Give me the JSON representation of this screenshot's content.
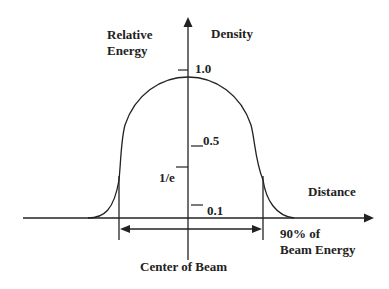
{
  "diagram": {
    "labels": {
      "y_axis_line1": "Relative",
      "y_axis_line2": "Energy",
      "y_axis_right": "Density",
      "x_axis": "Distance",
      "width_label_line1": "90% of",
      "width_label_line2": "Beam Energy",
      "center_label": "Center of Beam"
    },
    "ticks": {
      "t1": "1.0",
      "t05": "0.5",
      "t1e": "1/e",
      "t01": "0.1"
    },
    "colors": {
      "line": "#222222",
      "background": "#ffffff"
    }
  }
}
